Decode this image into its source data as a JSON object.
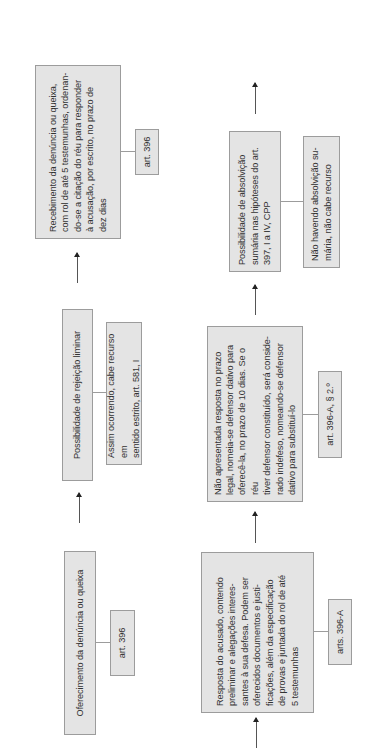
{
  "diagram": {
    "orientation": "rotated-90-ccw",
    "colors": {
      "box_fill": "#e4e4e4",
      "box_border": "#9c9c9c",
      "text": "#333333",
      "arrow": "#222222"
    },
    "row1": {
      "step1": {
        "text": "Oferecimento da denúncia ou queixa",
        "ref": "art. 396"
      },
      "step2": {
        "text": "Possibilidade de rejeição liminar",
        "note": "Assim ocorrendo, cabe recurso em\nsentido estrito, art. 581, I"
      },
      "step3": {
        "text": "Recebimento da denúncia ou queixa,\ncom rol de até 5 testemunhas, ordenan-\ndo-se a citação do réu para responder\nà acusação, por escrito, no prazo de\ndez dias",
        "ref": "art. 396"
      }
    },
    "row2": {
      "step1": {
        "text": "Resposta do acusado, contendo\npreliminar e alegações interes-\nsantes à sua defesa. Podem ser\noferecidos documentos e justi-\nficações, além da especificação\nde provas e juntada do rol de até\n5 testemunhas",
        "ref": "arts. 396-A"
      },
      "step2": {
        "text": "Não apresentada resposta no prazo\nlegal, nomeia-se defensor dativo para\noferecê-la, no prazo de 10 dias. Se o réu\ntiver defensor constituído, será conside-\nrado indefeso, nomeando-se defensor\ndativo para substituí-lo",
        "ref": "art. 396-A, § 2.º"
      },
      "step3": {
        "text": "Possibilidade de absolvição\nsumária nas hipóteses do art.\n397, I a IV, CPP",
        "note": "Não havendo absolvição su-\nmária, não cabe recurso"
      }
    }
  }
}
